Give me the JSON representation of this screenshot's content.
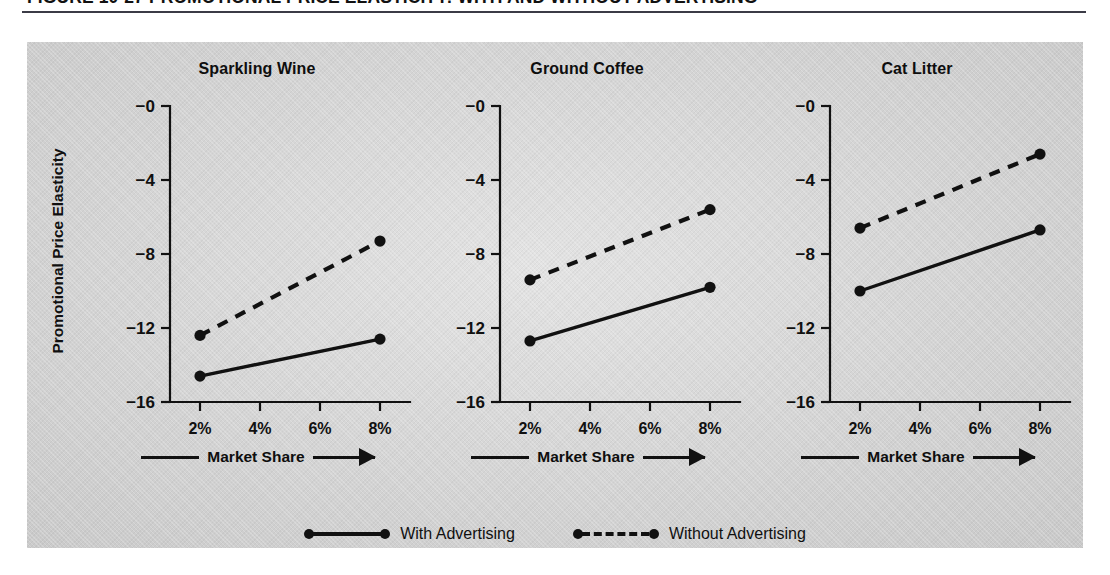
{
  "figure": {
    "title": "FIGURE 10-27  PROMOTIONAL PRICE ELASTICITY: WITH AND WITHOUT ADVERTISING",
    "y_axis_caption": "Promotional Price Elasticity",
    "x_axis_caption": "Market Share",
    "panel_bg": "#d4d4d4",
    "ink": "#111111"
  },
  "legend": {
    "entries": [
      {
        "label": "With Advertising",
        "style": "solid"
      },
      {
        "label": "Without Advertising",
        "style": "dashed"
      }
    ]
  },
  "chart_data": [
    {
      "type": "line",
      "title": "Sparkling Wine",
      "xlabel": "Market Share",
      "ylabel": "Promotional Price Elasticity",
      "x": [
        2,
        8
      ],
      "xticks": [
        "2%",
        "4%",
        "6%",
        "8%"
      ],
      "xtickvalues": [
        2,
        4,
        6,
        8
      ],
      "yticks": [
        "−0",
        "−4",
        "−8",
        "−12",
        "−16"
      ],
      "ytickvalues": [
        0,
        -4,
        -8,
        -12,
        -16
      ],
      "ylim": [
        -16,
        0
      ],
      "xlim": [
        1,
        9
      ],
      "grid": false,
      "series": [
        {
          "name": "With Advertising",
          "style": "solid",
          "values": [
            -14.6,
            -12.6
          ]
        },
        {
          "name": "Without Advertising",
          "style": "dashed",
          "values": [
            -12.4,
            -7.3
          ]
        }
      ]
    },
    {
      "type": "line",
      "title": "Ground Coffee",
      "xlabel": "Market Share",
      "ylabel": "Promotional Price Elasticity",
      "x": [
        2,
        8
      ],
      "xticks": [
        "2%",
        "4%",
        "6%",
        "8%"
      ],
      "xtickvalues": [
        2,
        4,
        6,
        8
      ],
      "yticks": [
        "−0",
        "−4",
        "−8",
        "−12",
        "−16"
      ],
      "ytickvalues": [
        0,
        -4,
        -8,
        -12,
        -16
      ],
      "ylim": [
        -16,
        0
      ],
      "xlim": [
        1,
        9
      ],
      "grid": false,
      "series": [
        {
          "name": "With Advertising",
          "style": "solid",
          "values": [
            -12.7,
            -9.8
          ]
        },
        {
          "name": "Without Advertising",
          "style": "dashed",
          "values": [
            -9.4,
            -5.6
          ]
        }
      ]
    },
    {
      "type": "line",
      "title": "Cat Litter",
      "xlabel": "Market Share",
      "ylabel": "Promotional Price Elasticity",
      "x": [
        2,
        8
      ],
      "xticks": [
        "2%",
        "4%",
        "6%",
        "8%"
      ],
      "xtickvalues": [
        2,
        4,
        6,
        8
      ],
      "yticks": [
        "−0",
        "−4",
        "−8",
        "−12",
        "−16"
      ],
      "ytickvalues": [
        0,
        -4,
        -8,
        -12,
        -16
      ],
      "ylim": [
        -16,
        0
      ],
      "xlim": [
        1,
        9
      ],
      "grid": false,
      "series": [
        {
          "name": "With Advertising",
          "style": "solid",
          "values": [
            -10.0,
            -6.7
          ]
        },
        {
          "name": "Without Advertising",
          "style": "dashed",
          "values": [
            -6.6,
            -2.6
          ]
        }
      ]
    }
  ]
}
